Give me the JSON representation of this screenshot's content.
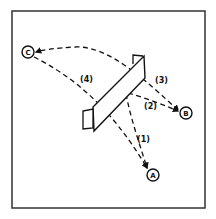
{
  "diagram": {
    "type": "trajectory-sketch",
    "frame": {
      "x": 12,
      "y": 11,
      "width": 193,
      "height": 197,
      "stroke": "#333333"
    },
    "nodes": [
      {
        "id": "C",
        "label": "C",
        "x": 28,
        "y": 52
      },
      {
        "id": "B",
        "label": "B",
        "x": 186,
        "y": 113
      },
      {
        "id": "A",
        "label": "A",
        "x": 153,
        "y": 175
      }
    ],
    "object": {
      "name": "panel",
      "description": "slanted rectangular board with small tabs at both ends"
    },
    "paths": [
      {
        "id": "1",
        "label": "(1)",
        "from": "panel",
        "to": "A"
      },
      {
        "id": "2",
        "label": "(2)",
        "from": "panel",
        "to": "B"
      },
      {
        "id": "3",
        "label": "(3)",
        "from": "C",
        "to": "B"
      },
      {
        "id": "4",
        "label": "(4)",
        "from": "C",
        "to": "A"
      }
    ],
    "colors": {
      "line": "#111111",
      "background": "#ffffff"
    }
  }
}
